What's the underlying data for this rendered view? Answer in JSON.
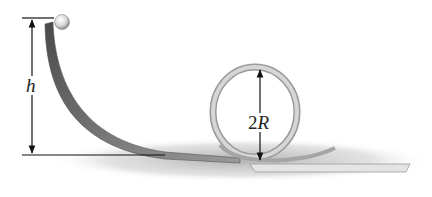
{
  "figure": {
    "labels": {
      "height": "h",
      "loop_diameter_prefix": "2",
      "loop_diameter_var": "R"
    },
    "colors": {
      "track_dark": "#5a5a5a",
      "track_light": "#c8c8c8",
      "shadow": "#bdbdbd",
      "lines": "#111111",
      "ball": "#e6e6e6"
    }
  }
}
